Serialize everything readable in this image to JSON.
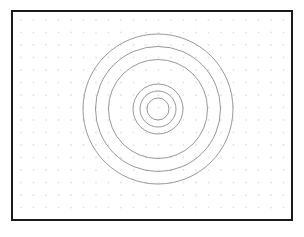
{
  "figure": {
    "title": "",
    "background_color": "#ffffff",
    "frame": {
      "border_color": "#1b1b1b",
      "border_width": 2,
      "fill_color": "#ffffff",
      "x": 11,
      "y": 10,
      "width": 282,
      "height": 211
    }
  },
  "grid": {
    "type": "dot-grid",
    "dot_color": "#e2e2e6",
    "dot_radius": 0.9,
    "spacing_x": 12.5,
    "spacing_y": 12.5,
    "offset_x": 8,
    "offset_y": 8,
    "columns": 22,
    "rows": 17
  },
  "chart_data": {
    "type": "scatter",
    "title": "",
    "subtitle": "",
    "xlabel": "",
    "ylabel": "",
    "grid": true,
    "legend": null,
    "annotations": [],
    "xlim": [
      0,
      282
    ],
    "ylim": [
      0,
      211
    ],
    "center": {
      "x": 145,
      "y": 97
    },
    "series": [
      {
        "name": "concentric-rings",
        "shape": "circle",
        "stroke_color": "#8b8b93",
        "stroke_width": 0.9,
        "fill": "none",
        "radii": [
          75,
          62.5,
          49.5,
          25,
          18,
          11
        ],
        "ring_labels": [
          "r1",
          "r2",
          "r3",
          "r4",
          "r5",
          "r6"
        ],
        "values": [
          75,
          62.5,
          49.5,
          25,
          18,
          11
        ]
      }
    ]
  }
}
